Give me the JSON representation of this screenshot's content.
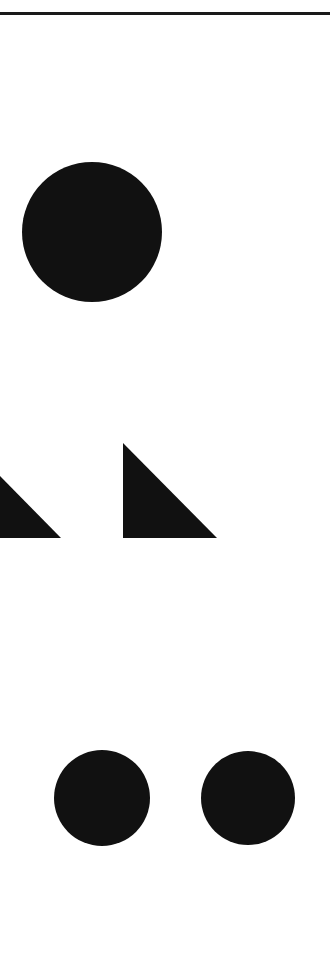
{
  "figure": {
    "background": "#ffffff",
    "ink_color": "#111111",
    "top_rule": {
      "y": 13,
      "thickness": 3,
      "color": "#1a1a1a"
    },
    "shapes": [
      {
        "id": "large-circle",
        "type": "circle",
        "cx": 92,
        "cy": 232,
        "r": 70
      },
      {
        "id": "left-triangle",
        "type": "right-triangle",
        "points": "0,476 61,538 0,538"
      },
      {
        "id": "right-triangle",
        "type": "right-triangle",
        "points": "123,443 217,538 123,538"
      },
      {
        "id": "small-circle-left",
        "type": "circle",
        "cx": 102,
        "cy": 798,
        "r": 48
      },
      {
        "id": "small-circle-right",
        "type": "circle",
        "cx": 248,
        "cy": 798,
        "r": 47
      }
    ]
  }
}
